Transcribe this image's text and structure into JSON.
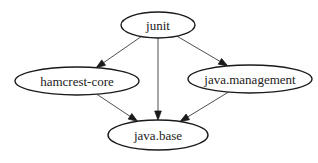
{
  "diagram": {
    "type": "directed-graph",
    "colors": {
      "node_stroke": "#1a1a1a",
      "edge": "#3a3a3a",
      "background": "#ffffff"
    },
    "nodes": [
      {
        "id": "junit",
        "label": "junit",
        "cx": 158,
        "cy": 25,
        "rx": 37,
        "ry": 13
      },
      {
        "id": "hamcrest-core",
        "label": "hamcrest-core",
        "cx": 77,
        "cy": 81,
        "rx": 62,
        "ry": 14
      },
      {
        "id": "java.management",
        "label": "java.management",
        "cx": 250,
        "cy": 79,
        "rx": 62,
        "ry": 14
      },
      {
        "id": "java.base",
        "label": "java.base",
        "cx": 158,
        "cy": 135,
        "rx": 50,
        "ry": 15
      }
    ],
    "edges": [
      {
        "from": "junit",
        "to": "hamcrest-core"
      },
      {
        "from": "junit",
        "to": "java.base"
      },
      {
        "from": "junit",
        "to": "java.management"
      },
      {
        "from": "hamcrest-core",
        "to": "java.base"
      },
      {
        "from": "java.management",
        "to": "java.base"
      }
    ]
  }
}
